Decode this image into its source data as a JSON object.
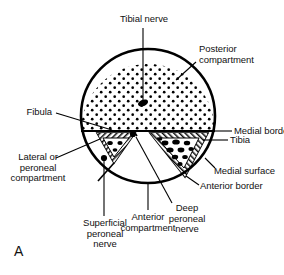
{
  "figure": {
    "panel_letter": "A",
    "colors": {
      "outline": "#000000",
      "stipple": "#000000",
      "background": "#ffffff",
      "bone_hatch": "#000000",
      "nerve": "#000000"
    }
  },
  "labels": {
    "tibial_nerve": "Tibial nerve",
    "posterior_compartment": "Posterior\ncompartment",
    "fibula": "Fibula",
    "medial_border": "Medial border",
    "tibia": "Tibia",
    "medial_surface": "Medial surface",
    "anterior_border": "Anterior border",
    "lateral_or_peroneal_compartment": "Lateral or\nperoneal\ncompartment",
    "anterior_compartment": "Anterior\ncompartment",
    "deep_peroneal_nerve": "Deep\nperoneal\nnerve",
    "superficial_peroneal_nerve": "Superficial\nperoneal\nnerve"
  },
  "structures": [
    {
      "name": "leg-outline-circle",
      "type": "circle",
      "cx": 148,
      "cy": 116,
      "r": 67
    },
    {
      "name": "interosseous-line",
      "type": "line",
      "x1": 81,
      "y1": 131,
      "x2": 215,
      "y2": 131
    },
    {
      "name": "tibia-bone",
      "type": "triangle"
    },
    {
      "name": "fibula-bone",
      "type": "triangle"
    },
    {
      "name": "tibial-nerve-marker",
      "type": "oval",
      "cx": 143,
      "cy": 103
    },
    {
      "name": "deep-peroneal-nerve-marker",
      "type": "dot",
      "cx": 133,
      "cy": 134
    },
    {
      "name": "superficial-peroneal-nerve-marker",
      "type": "dot",
      "cx": 104,
      "cy": 158
    }
  ]
}
